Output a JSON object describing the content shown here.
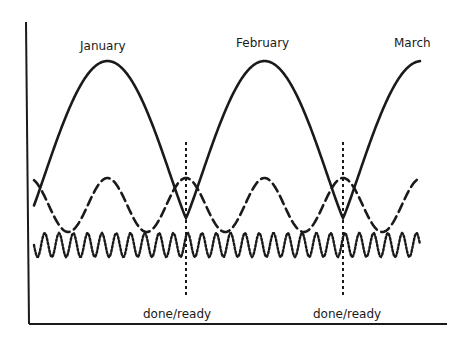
{
  "diagram": {
    "type": "cycle-diagram",
    "ink_color": "#1a1a1a",
    "background": "#ffffff",
    "period_labels": [
      "January",
      "February",
      "March"
    ],
    "markers": [
      {
        "label": "done/ready"
      },
      {
        "label": "done/ready"
      }
    ],
    "curves": [
      {
        "name": "monthly-cycle",
        "style": "solid",
        "cycles_shown": 2.5
      },
      {
        "name": "half-month-cycle",
        "style": "dashed",
        "cycles_shown": 5
      },
      {
        "name": "short-cycle",
        "style": "dotted",
        "cycles_shown": 22
      }
    ]
  }
}
